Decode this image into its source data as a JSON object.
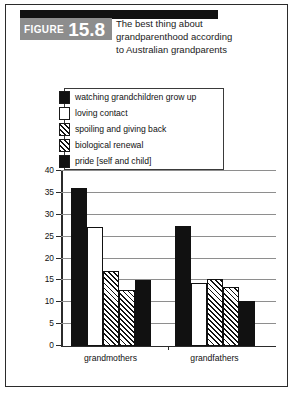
{
  "figure": {
    "label": "FIGURE",
    "number": "15.8",
    "title_lines": [
      "The best thing about",
      "grandparenthood according",
      "to Australian grandparents"
    ],
    "badge_color": "#8d8d8d",
    "bar_color": "#111111"
  },
  "chart_data": {
    "type": "bar",
    "title": "The best thing about grandparenthood according to Australian grandparents",
    "xlabel": "",
    "ylabel": "percentage of grandparents mentioning reason",
    "categories": [
      "grandmothers",
      "grandfathers"
    ],
    "ylim": [
      0,
      40
    ],
    "yticks": [
      0,
      5,
      10,
      15,
      20,
      25,
      30,
      35,
      40
    ],
    "ytick_labels": [
      "0",
      "5",
      "10",
      "15",
      "20",
      "25",
      "30",
      "35",
      "40"
    ],
    "grid": true,
    "legend_position": "top-center",
    "series": [
      {
        "name": "watching grandchildren grow up",
        "pattern": "solid-black",
        "values": [
          36,
          27.3
        ]
      },
      {
        "name": "loving contact",
        "pattern": "white",
        "values": [
          27,
          14.3
        ]
      },
      {
        "name": "spoiling and giving back",
        "pattern": "diagonal-hatch",
        "values": [
          17,
          15.2
        ]
      },
      {
        "name": "biological renewal",
        "pattern": "cross-hatch",
        "values": [
          12.7,
          13.3
        ]
      },
      {
        "name": "pride [self and child]",
        "pattern": "solid-black",
        "values": [
          15,
          10.2
        ]
      }
    ]
  }
}
